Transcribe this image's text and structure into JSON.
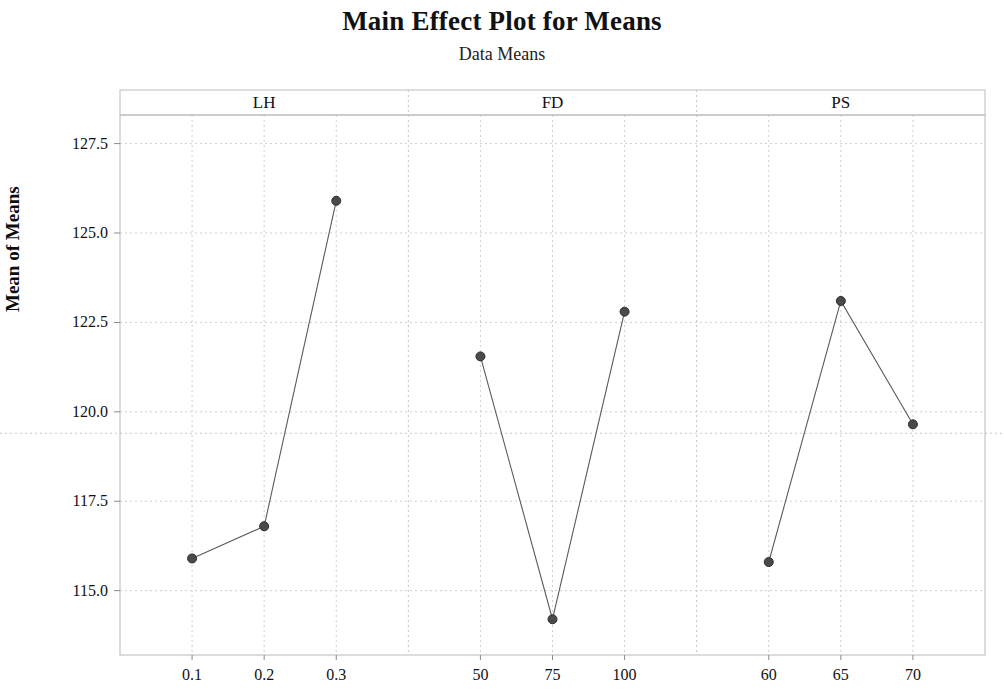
{
  "chart_data": {
    "type": "line",
    "title": "Main Effect Plot for Means",
    "subtitle": "Data Means",
    "xlabel": "",
    "ylabel": "Mean of Means",
    "ylim": [
      113.2,
      128.3
    ],
    "yticks": [
      115.0,
      117.5,
      120.0,
      122.5,
      125.0,
      127.5
    ],
    "ytick_labels": [
      "115.0",
      "117.5",
      "120.0",
      "122.5",
      "125.0",
      "127.5"
    ],
    "grid": true,
    "legend": null,
    "reference_line": 119.4,
    "panels": [
      {
        "name": "LH",
        "categories": [
          "0.1",
          "0.2",
          "0.3"
        ],
        "values": [
          115.9,
          116.8,
          125.9
        ]
      },
      {
        "name": "FD",
        "categories": [
          "50",
          "75",
          "100"
        ],
        "values": [
          121.55,
          114.2,
          122.8
        ]
      },
      {
        "name": "PS",
        "categories": [
          "60",
          "65",
          "70"
        ],
        "values": [
          115.8,
          123.1,
          119.65
        ]
      }
    ],
    "marker": {
      "shape": "circle",
      "color": "#4a4a4a",
      "edge_color": "#2e2e2e",
      "size": 8
    },
    "line_color": "#5a5a5a",
    "grid_color": "#cfcfcf",
    "background_color": "#ffffff"
  }
}
